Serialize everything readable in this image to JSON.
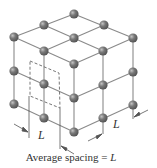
{
  "diagram": {
    "lattice": {
      "nx": 3,
      "ny": 3,
      "nz": 3
    },
    "colors": {
      "line": "#8a8a8a",
      "atom": "#7a7a7a",
      "atom_highlight": "#c4c4c4",
      "atom_dark": "#555555",
      "dash": "#666666",
      "text": "#333333"
    },
    "nodes": [
      [
        74,
        14
      ],
      [
        44,
        25
      ],
      [
        104,
        25
      ],
      [
        14,
        37
      ],
      [
        74,
        38
      ],
      [
        133,
        38
      ],
      [
        44,
        51
      ],
      [
        103,
        51
      ],
      [
        74,
        64
      ],
      [
        14,
        71
      ],
      [
        133,
        72
      ],
      [
        44,
        84
      ],
      [
        103,
        85
      ],
      [
        74,
        98
      ],
      [
        14,
        104
      ],
      [
        133,
        105
      ],
      [
        44,
        118
      ],
      [
        103,
        118
      ],
      [
        74,
        132
      ]
    ],
    "dimension_labels": [
      {
        "text": "L",
        "x": 40,
        "y": 131
      },
      {
        "text": "L",
        "x": 114,
        "y": 120
      }
    ],
    "caption": {
      "prefix": "Average spacing = ",
      "var": "L"
    }
  }
}
